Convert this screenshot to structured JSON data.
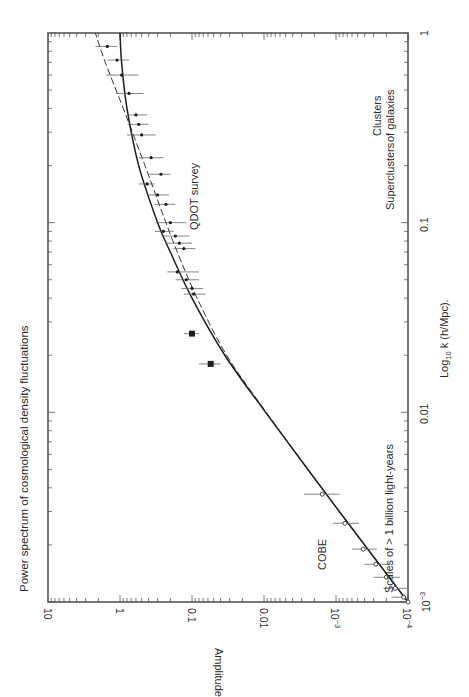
{
  "chart_data": {
    "type": "scatter",
    "title": "Power spectrum of cosmological density fluctuations",
    "xlabel": "Log10 k (h/Mpc).",
    "ylabel": "Amplitude",
    "xscale": "log",
    "yscale": "log",
    "xlim": [
      0.001,
      1
    ],
    "ylim": [
      0.0001,
      10
    ],
    "orientation": "rotated 90 degrees counter-clockwise (k axis vertical, amplitude axis horizontal and reversed)",
    "x_ticks": [
      "10^-3",
      "0.01",
      "0.1",
      "1"
    ],
    "y_ticks": [
      "10^-4",
      "10^-3",
      "0.01",
      "0.1",
      "1",
      "10"
    ],
    "grid": false,
    "annotations": [
      {
        "text": "QDOT survey",
        "k": 0.09,
        "amplitude": 0.09
      },
      {
        "text": "COBE",
        "k": 0.0015,
        "amplitude": 0.0011
      },
      {
        "text": "Scales of > 1 billion light-years",
        "k": 0.003,
        "amplitude": 0.0001
      },
      {
        "text": "Superclusters",
        "k": 0.15,
        "amplitude": 0.0001
      },
      {
        "text": "Clusters of galaxies",
        "k": 0.45,
        "amplitude": 0.0001
      }
    ],
    "series": [
      {
        "name": "COBE",
        "marker": "open-circle",
        "points": [
          {
            "k": 0.0037,
            "amplitude": 0.00155,
            "err_lo": 0.0009,
            "err_hi": 0.0028
          },
          {
            "k": 0.0026,
            "amplitude": 0.00075,
            "err_lo": 0.00048,
            "err_hi": 0.0011
          },
          {
            "k": 0.0019,
            "amplitude": 0.00042,
            "err_lo": 0.00027,
            "err_hi": 0.0006
          },
          {
            "k": 0.00158,
            "amplitude": 0.00028,
            "err_lo": 0.00018,
            "err_hi": 0.0004
          },
          {
            "k": 0.00135,
            "amplitude": 0.0002,
            "err_lo": 0.00013,
            "err_hi": 0.0003
          },
          {
            "k": 0.00118,
            "amplitude": 0.00015,
            "err_lo": 0.0001,
            "err_hi": 0.00022
          },
          {
            "k": 0.00106,
            "amplitude": 0.000115,
            "err_lo": 0.0001,
            "err_hi": 0.00017
          },
          {
            "k": 0.001,
            "amplitude": 0.0001,
            "err_lo": 0.0001,
            "err_hi": 0.00013
          }
        ]
      },
      {
        "name": "Large-scale (filled squares)",
        "marker": "filled-square",
        "points": [
          {
            "k": 0.026,
            "amplitude": 0.1,
            "err_lo": 0.08,
            "err_hi": 0.13
          },
          {
            "k": 0.018,
            "amplitude": 0.055,
            "err_lo": 0.04,
            "err_hi": 0.08
          }
        ]
      },
      {
        "name": "QDOT survey",
        "marker": "filled-dot",
        "points": [
          {
            "k": 0.85,
            "amplitude": 1.5,
            "err_lo": 1.1,
            "err_hi": 2.2
          },
          {
            "k": 0.72,
            "amplitude": 1.1,
            "err_lo": 0.75,
            "err_hi": 1.5
          },
          {
            "k": 0.6,
            "amplitude": 0.95,
            "err_lo": 0.55,
            "err_hi": 1.55
          },
          {
            "k": 0.48,
            "amplitude": 0.75,
            "err_lo": 0.47,
            "err_hi": 1.15
          },
          {
            "k": 0.37,
            "amplitude": 0.6,
            "err_lo": 0.42,
            "err_hi": 0.8
          },
          {
            "k": 0.33,
            "amplitude": 0.55,
            "err_lo": 0.4,
            "err_hi": 0.78
          },
          {
            "k": 0.29,
            "amplitude": 0.5,
            "err_lo": 0.32,
            "err_hi": 0.8
          },
          {
            "k": 0.22,
            "amplitude": 0.37,
            "err_lo": 0.25,
            "err_hi": 0.55
          },
          {
            "k": 0.18,
            "amplitude": 0.27,
            "err_lo": 0.2,
            "err_hi": 0.4
          },
          {
            "k": 0.16,
            "amplitude": 0.42,
            "err_lo": 0.33,
            "err_hi": 0.55
          },
          {
            "k": 0.14,
            "amplitude": 0.3,
            "err_lo": 0.21,
            "err_hi": 0.42
          },
          {
            "k": 0.125,
            "amplitude": 0.23,
            "err_lo": 0.17,
            "err_hi": 0.33
          },
          {
            "k": 0.1,
            "amplitude": 0.2,
            "err_lo": 0.12,
            "err_hi": 0.32
          },
          {
            "k": 0.09,
            "amplitude": 0.25,
            "err_lo": 0.18,
            "err_hi": 0.33
          },
          {
            "k": 0.085,
            "amplitude": 0.17,
            "err_lo": 0.11,
            "err_hi": 0.25
          },
          {
            "k": 0.078,
            "amplitude": 0.15,
            "err_lo": 0.1,
            "err_hi": 0.23
          },
          {
            "k": 0.073,
            "amplitude": 0.13,
            "err_lo": 0.09,
            "err_hi": 0.18
          },
          {
            "k": 0.055,
            "amplitude": 0.16,
            "err_lo": 0.08,
            "err_hi": 0.22
          },
          {
            "k": 0.05,
            "amplitude": 0.12,
            "err_lo": 0.08,
            "err_hi": 0.17
          },
          {
            "k": 0.045,
            "amplitude": 0.1,
            "err_lo": 0.07,
            "err_hi": 0.14
          },
          {
            "k": 0.042,
            "amplitude": 0.095,
            "err_lo": 0.065,
            "err_hi": 0.13
          }
        ]
      },
      {
        "name": "Model (solid)",
        "type": "line",
        "style": "solid",
        "points": [
          {
            "k": 0.001,
            "amplitude": 0.0001
          },
          {
            "k": 0.003,
            "amplitude": 0.0009
          },
          {
            "k": 0.01,
            "amplitude": 0.0095
          },
          {
            "k": 0.02,
            "amplitude": 0.035
          },
          {
            "k": 0.04,
            "amplitude": 0.1
          },
          {
            "k": 0.07,
            "amplitude": 0.2
          },
          {
            "k": 0.1,
            "amplitude": 0.3
          },
          {
            "k": 0.2,
            "amplitude": 0.55
          },
          {
            "k": 0.4,
            "amplitude": 0.8
          },
          {
            "k": 0.7,
            "amplitude": 0.95
          },
          {
            "k": 1,
            "amplitude": 1.0
          }
        ]
      },
      {
        "name": "Model (dashed)",
        "type": "line",
        "style": "dashed",
        "points": [
          {
            "k": 0.001,
            "amplitude": 0.0001
          },
          {
            "k": 0.003,
            "amplitude": 0.0009
          },
          {
            "k": 0.01,
            "amplitude": 0.0093
          },
          {
            "k": 0.02,
            "amplitude": 0.033
          },
          {
            "k": 0.04,
            "amplitude": 0.085
          },
          {
            "k": 0.07,
            "amplitude": 0.16
          },
          {
            "k": 0.1,
            "amplitude": 0.23
          },
          {
            "k": 0.2,
            "amplitude": 0.45
          },
          {
            "k": 0.4,
            "amplitude": 0.9
          },
          {
            "k": 0.7,
            "amplitude": 1.6
          },
          {
            "k": 1,
            "amplitude": 2.2
          }
        ]
      }
    ]
  },
  "labels": {
    "title": "Power spectrum of cosmological density fluctuations",
    "amplitude_axis": "Amplitude",
    "k_axis_prefix": "Log",
    "k_axis_sub": "10",
    "k_axis_suffix": " k (h/Mpc).",
    "qdot": "QDOT survey",
    "cobe": "COBE",
    "billion": "Scales of > 1 billion light-years",
    "superclusters": "Superclusters",
    "clusters_line1": "Clusters",
    "clusters_line2": "of galaxies"
  },
  "amp_ticks": [
    {
      "value": 10,
      "label": "10",
      "exp": ""
    },
    {
      "value": 1,
      "label": "1",
      "exp": ""
    },
    {
      "value": 0.1,
      "label": "0.1",
      "exp": ""
    },
    {
      "value": 0.01,
      "label": "0.01",
      "exp": ""
    },
    {
      "value": 0.001,
      "label": "10",
      "exp": "−3"
    },
    {
      "value": 0.0001,
      "label": "10",
      "exp": "−4"
    }
  ],
  "k_ticks": [
    {
      "value": 1,
      "label": "1",
      "exp": ""
    },
    {
      "value": 0.1,
      "label": "0.1",
      "exp": ""
    },
    {
      "value": 0.01,
      "label": "0.01",
      "exp": ""
    },
    {
      "value": 0.001,
      "label": "10",
      "exp": "−3"
    }
  ],
  "colors": {
    "ink": "#1e1e1e",
    "frame": "#555555",
    "text": "#2a2a2a",
    "background": "#ffffff"
  }
}
